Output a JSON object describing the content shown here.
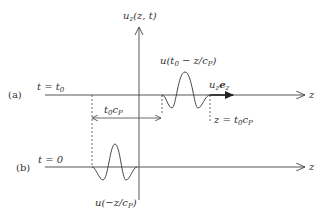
{
  "axis": {
    "vertical_label": "u",
    "vertical_label_sub": "z",
    "vertical_label_args": "(z, t)",
    "horizontal_label": "z"
  },
  "panel_a": {
    "tag": "(a)",
    "time_label": "t = t",
    "time_label_sub": "0",
    "pulse_label_pre": "u(t",
    "pulse_label_sub0": "0",
    "pulse_label_mid": " − z/c",
    "pulse_label_subP": "P",
    "pulse_label_end": ")",
    "velocity_label": "u",
    "velocity_label_sub": "z",
    "velocity_label_e": "e",
    "velocity_label_esub": "z",
    "distance_label": "t",
    "distance_label_sub0": "0",
    "distance_label_c": "c",
    "distance_label_subP": "P",
    "position_label_pre": "z = t",
    "position_label_sub0": "0",
    "position_label_c": "c",
    "position_label_subP": "P"
  },
  "panel_b": {
    "tag": "(b)",
    "time_label": "t = 0",
    "pulse_label_pre": "u(−z/c",
    "pulse_label_subP": "P",
    "pulse_label_end": ")"
  }
}
